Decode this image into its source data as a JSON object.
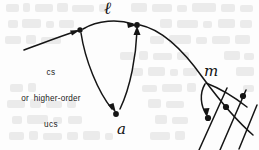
{
  "page": {
    "type": "scanned-handwritten-diagram",
    "width": 259,
    "height": 150,
    "background_color": "#fdfdfd",
    "ink_color": "#151515",
    "bleed_through_color": "#e8e8e8"
  },
  "labels": {
    "text_block": {
      "name": "cs-or-higher-order-ucs-label",
      "lines": [
        "cs",
        "or  higher-order",
        "ucs"
      ]
    },
    "script_letters": [
      {
        "name": "script-l",
        "glyph": "ℓ",
        "x": 104,
        "y": -2
      },
      {
        "name": "script-a",
        "glyph": "a",
        "x": 117,
        "y": 120
      },
      {
        "name": "script-m",
        "glyph": "m",
        "x": 204,
        "y": 62
      }
    ]
  },
  "nodes": [
    {
      "name": "node-left-vertex",
      "x": 80,
      "y": 30
    },
    {
      "name": "node-top-vertex",
      "x": 137,
      "y": 25
    },
    {
      "name": "node-a-vertex",
      "x": 116,
      "y": 113
    },
    {
      "name": "node-m-junction",
      "x": 207,
      "y": 82
    },
    {
      "name": "node-dot-lower-left",
      "x": 208,
      "y": 117
    },
    {
      "name": "node-dot-middle",
      "x": 226,
      "y": 106
    },
    {
      "name": "node-dot-upper-right",
      "x": 243,
      "y": 96
    }
  ],
  "edges": [
    {
      "name": "arrow-incoming-from-lower-left",
      "from": [
        24,
        50
      ],
      "to": [
        80,
        30
      ],
      "arrowhead": "to"
    },
    {
      "name": "arrow-left-vertex-to-top-vertex",
      "from": [
        80,
        30
      ],
      "to": [
        137,
        25
      ],
      "arrowhead": "to",
      "curved": true
    },
    {
      "name": "curve-left-vertex-down-to-a",
      "from": [
        80,
        30
      ],
      "to": [
        116,
        113
      ],
      "arrowhead": "to",
      "curved": true
    },
    {
      "name": "curve-a-up-to-top-vertex",
      "from": [
        116,
        113
      ],
      "to": [
        137,
        25
      ],
      "arrowhead": "to",
      "curved": true
    },
    {
      "name": "main-curve-top-vertex-to-m",
      "from": [
        137,
        25
      ],
      "to": [
        252,
        133
      ],
      "arrowhead": "none",
      "curved": true
    },
    {
      "name": "arc-from-m-junction",
      "from": [
        207,
        82
      ],
      "to": [
        248,
        108
      ],
      "arrowhead": "none",
      "curved": true
    },
    {
      "name": "diagonal-line-left",
      "from": [
        199,
        150
      ],
      "to": [
        226,
        89
      ]
    },
    {
      "name": "diagonal-line-middle",
      "from": [
        219,
        150
      ],
      "to": [
        245,
        89
      ]
    },
    {
      "name": "diagonal-line-right",
      "from": [
        238,
        148
      ],
      "to": [
        256,
        104
      ]
    },
    {
      "name": "arrow-into-lower-left-dot",
      "from": [
        207,
        82
      ],
      "to": [
        208,
        117
      ],
      "arrowhead": "to",
      "curved": true
    }
  ]
}
